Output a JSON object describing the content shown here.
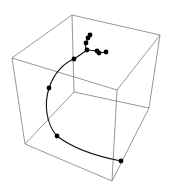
{
  "chart_data": {
    "type": "scatter3d",
    "title": "",
    "xlabel": "",
    "ylabel": "",
    "zlabel": "",
    "axes_visible": false,
    "box": true,
    "grid": false,
    "legend": null,
    "style": {
      "box_color": "#6a6a6a",
      "line_color": "#111111",
      "point_color": "#000000",
      "background": "#ffffff"
    },
    "box_vertices_px": {
      "top_back_left": [
        72,
        15
      ],
      "top_back_right": [
        160,
        35
      ],
      "top_front_left": [
        12,
        58
      ],
      "top_front_right": [
        117,
        90
      ],
      "bottom_back_left": [
        74,
        92
      ],
      "bottom_back_right": [
        149,
        108
      ],
      "bottom_front_left": [
        25,
        144
      ],
      "bottom_front_right": [
        112,
        181
      ]
    },
    "series": [
      {
        "name": "trajectory",
        "mode": "lines+markers",
        "points_px": [
          [
            121,
            161
          ],
          [
            57,
            136
          ],
          [
            49,
            88
          ],
          [
            74,
            59
          ],
          [
            87,
            50
          ],
          [
            97,
            51
          ],
          [
            99,
            53
          ],
          [
            106,
            52
          ],
          [
            86,
            43
          ],
          [
            88,
            38
          ],
          [
            90,
            35
          ]
        ],
        "curve_path_px": "M121,161 C100,157 75,150 57,136 C46,124 44,104 49,88 C54,73 64,63 74,59 C80,55 84,52 87,50 M87,50 C91,50 94,51 97,51 L99,53 L106,52 M87,50 C85,47 85,45 86,43 L88,38 L90,35"
      }
    ]
  }
}
